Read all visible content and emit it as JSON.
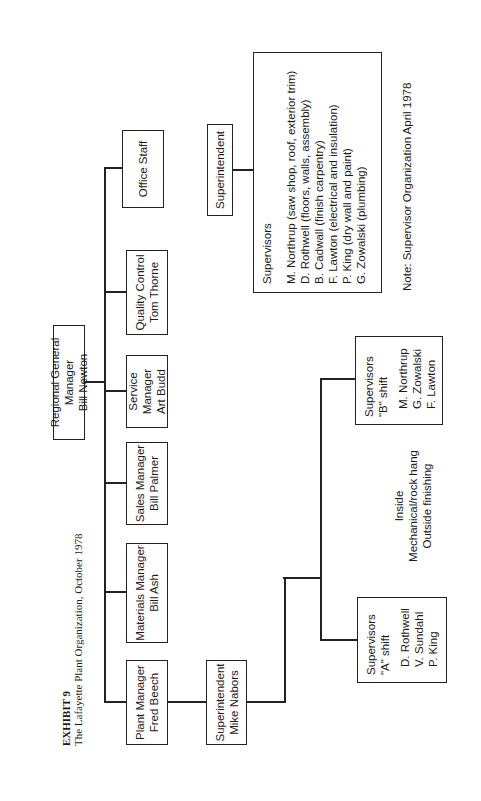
{
  "header": {
    "exhibit_label": "EXHIBIT 9",
    "title": "The Lafayette Plant Organization, October 1978"
  },
  "org_chart": {
    "root": {
      "title": "Regional General Manager",
      "name": "Bill Newton"
    },
    "direct_reports": [
      {
        "title": "Plant Manager",
        "name": "Fred Beech"
      },
      {
        "title": "Materials Manager",
        "name": "Bill Ash"
      },
      {
        "title": "Sales Manager",
        "name": "Bill Palmer"
      },
      {
        "title": "Service Manager",
        "name": "Art Budd"
      },
      {
        "title": "Quality Control",
        "name": "Tom Thorne"
      },
      {
        "title": "Office Staff",
        "name": ""
      }
    ],
    "plant_superintendent": {
      "title": "Superintendent",
      "name": "Mike Nabors"
    },
    "shift_a": {
      "heading": "Supervisors",
      "shift": "\"A\" shift",
      "members": [
        "D. Rothwell",
        "V. Sundahl",
        "P. King"
      ]
    },
    "shift_b": {
      "heading": "Supervisors",
      "shift": "\"B\" shift",
      "members": [
        "M. Northrup",
        "G. Zowalski",
        "F. Lawton"
      ]
    },
    "functions": [
      "Inside",
      "Mechanical/rock hang",
      "Outside finishing"
    ]
  },
  "april_1978": {
    "superintendent": "Superintendent",
    "heading": "Supervisors",
    "members": [
      "M. Northrup (saw shop, roof, exterior trim)",
      "D. Rothwell (floors, walls, assembly)",
      "B. Cadwall (finish carpentry)",
      "F. Lawton (electrical and insulation)",
      "P. King (dry wall and paint)",
      "G. Zowalski (plumbing)"
    ],
    "note": "Note: Supervisor Organization April 1978"
  }
}
